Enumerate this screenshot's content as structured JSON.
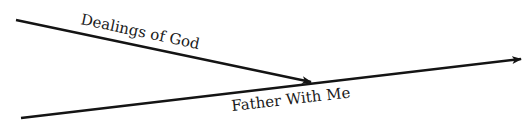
{
  "diagram": {
    "colors": {
      "line": "#141414",
      "text": "#1a1a1a",
      "background": "#ffffff"
    },
    "arrows": [
      {
        "id": "dealings",
        "label": "Dealings of God",
        "from": [
          16,
          20
        ],
        "to": [
          311,
          82
        ]
      },
      {
        "id": "father",
        "label": "Father With Me",
        "from": [
          21,
          118
        ],
        "to": [
          521,
          59
        ]
      }
    ],
    "labels": {
      "dealings": "Dealings of God",
      "father": "Father With Me"
    }
  }
}
